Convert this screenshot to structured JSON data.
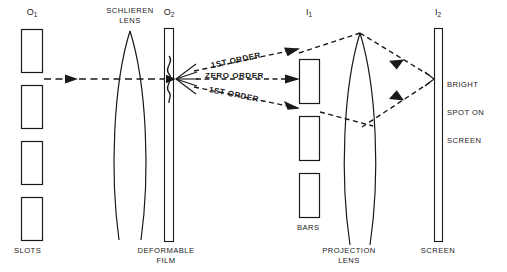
{
  "diagram": {
    "background_color": "#ffffff",
    "line_color": "#1a1a1a",
    "planes": [
      {
        "id": "o1",
        "label": "O",
        "subscript": "1",
        "name": "object-plane-1"
      },
      {
        "id": "o2",
        "label": "O",
        "subscript": "2",
        "name": "object-plane-2"
      },
      {
        "id": "i1",
        "label": "I",
        "subscript": "1",
        "name": "image-plane-1"
      },
      {
        "id": "i2",
        "label": "I",
        "subscript": "2",
        "name": "image-plane-2"
      }
    ],
    "components": {
      "slots": {
        "caption": "SLOTS",
        "count": 4
      },
      "schlieren_lens": {
        "caption_line1": "SCHLIEREN",
        "caption_line2": "LENS"
      },
      "deformable_film": {
        "caption_line1": "DEFORMABLE",
        "caption_line2": "FILM"
      },
      "bars": {
        "caption": "BARS",
        "count": 3
      },
      "projection_lens": {
        "caption_line1": "PROJECTION",
        "caption_line2": "LENS"
      },
      "screen": {
        "caption": "SCREEN"
      }
    },
    "rays": {
      "first_order_upper": "1ST ORDER",
      "zero_order": "ZERO ORDER",
      "first_order_lower": "1ST ORDER"
    },
    "annotations": {
      "bright_spot_line1": "BRIGHT",
      "bright_spot_line2": "SPOT ON",
      "bright_spot_line3": "SCREEN"
    }
  }
}
